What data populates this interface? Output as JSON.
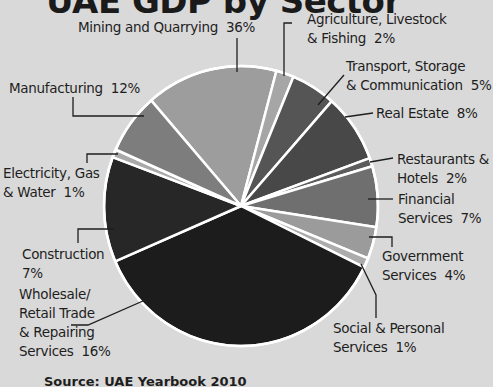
{
  "chart_data": {
    "type": "pie",
    "title": "UAE GDP by Sector",
    "source": "Source: UAE Yearbook 2010",
    "unit": "%",
    "slices": [
      {
        "label": "Mining and Quarrying",
        "value": 36,
        "color": "#9d9d9d",
        "start": -41,
        "end": 15
      },
      {
        "label": "Agriculture, Livestock & Fishing",
        "value": 2,
        "color": "#a6a6a6",
        "start": 15,
        "end": 22.5
      },
      {
        "label": "Transport, Storage & Communication",
        "value": 5,
        "color": "#555555",
        "start": 22.5,
        "end": 41.5
      },
      {
        "label": "Real Estate",
        "value": 8,
        "color": "#484848",
        "start": 41.5,
        "end": 70
      },
      {
        "label": "Restaurants & Hotels",
        "value": 2,
        "color": "#5c5c5c",
        "start": 70,
        "end": 73.5
      },
      {
        "label": "Financial Services",
        "value": 7,
        "color": "#6f6f6f",
        "start": 73.5,
        "end": 98.7
      },
      {
        "label": "Government Services",
        "value": 4,
        "color": "#9b9b9b",
        "start": 98.7,
        "end": 112
      },
      {
        "label": "Social & Personal Services",
        "value": 1,
        "color": "#acacac",
        "start": 112,
        "end": 116
      },
      {
        "label": "Wholesale/Retail Trade & Repairing Services",
        "value": 16,
        "color": "#1c1c1c",
        "start": 116,
        "end": 246.7
      },
      {
        "label": "Construction",
        "value": 7,
        "color": "#272727",
        "start": 246.7,
        "end": 290.4
      },
      {
        "label": "Electricity, Gas & Water",
        "value": 1,
        "color": "#a9a9a9",
        "start": 290.4,
        "end": 293.8
      },
      {
        "label": "Manufacturing",
        "value": 12,
        "color": "#7d7d7d",
        "start": 293.8,
        "end": 319
      }
    ]
  },
  "labels": {
    "mining": "Mining and Quarrying  36%",
    "agriculture": "Agriculture, Livestock\n& Fishing  2%",
    "transport": "Transport, Storage\n& Communication  5%",
    "real_estate": "Real Estate  8%",
    "restaurants": "Restaurants &\nHotels  2%",
    "financial": "Financial\nServices  7%",
    "government": "Government\nServices  4%",
    "social": "Social & Personal\nServices  1%",
    "wholesale": "Wholesale/\nRetail Trade\n& Repairing\nServices  16%",
    "construction": "Construction\n7%",
    "electricity": "Electricity, Gas\n& Water  1%",
    "manufacturing": "Manufacturing  12%"
  }
}
